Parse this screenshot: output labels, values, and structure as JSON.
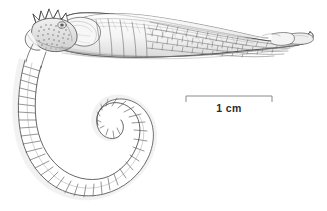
{
  "figure": {
    "domain_kind": "scientific-line-illustration",
    "background_color": "#ffffff",
    "ink_color": "#3a3a3a",
    "shade_color": "#b9b9b9",
    "light_shade_color": "#e8e8e8",
    "subject_name": "seahorse-lateral-view",
    "orientation": "lateral",
    "view_label": ""
  },
  "scale_bar": {
    "label": "1 cm",
    "label_color": "#2b2b2b",
    "bar_color": "#808080",
    "x_start": 186,
    "x_end": 272,
    "y": 96,
    "tick_height": 6,
    "length_px": 86,
    "represents_value": 1,
    "represents_unit": "cm"
  },
  "anatomy": {
    "parts": [
      {
        "name": "head-crown-spines",
        "label": ""
      },
      {
        "name": "head-plate",
        "label": ""
      },
      {
        "name": "snout",
        "label": ""
      },
      {
        "name": "eye",
        "label": ""
      },
      {
        "name": "pectoral-fin",
        "label": ""
      },
      {
        "name": "trunk-rings",
        "label": ""
      },
      {
        "name": "dorsal-fin",
        "label": ""
      },
      {
        "name": "body-scale-plates",
        "label": ""
      },
      {
        "name": "tail-tip",
        "label": ""
      },
      {
        "name": "curled-tail-segments",
        "label": ""
      }
    ]
  }
}
